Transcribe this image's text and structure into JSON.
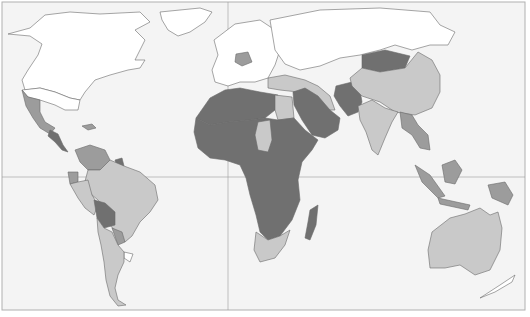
{
  "map": {
    "type": "choropleth-world",
    "projection": "equirectangular-like",
    "background": "#f4f4f4",
    "frame_color": "#b0b0b0",
    "graticule": {
      "equator_y": 177,
      "prime_meridian_x": 228,
      "color": "#9a9a9a"
    },
    "shade_classes": [
      {
        "id": "none",
        "color": "#ffffff"
      },
      {
        "id": "light",
        "color": "#c9c9c9"
      },
      {
        "id": "medium",
        "color": "#9c9c9c"
      },
      {
        "id": "dark",
        "color": "#707070"
      }
    ],
    "regions": [
      {
        "name": "North America (Canada/USA)",
        "class": "none"
      },
      {
        "name": "Greenland",
        "class": "none"
      },
      {
        "name": "Mexico",
        "class": "medium"
      },
      {
        "name": "Central America",
        "class": "dark"
      },
      {
        "name": "Caribbean",
        "class": "medium"
      },
      {
        "name": "Venezuela/Colombia",
        "class": "medium"
      },
      {
        "name": "Guyana",
        "class": "dark"
      },
      {
        "name": "Ecuador",
        "class": "medium"
      },
      {
        "name": "Brazil",
        "class": "light"
      },
      {
        "name": "Peru",
        "class": "light"
      },
      {
        "name": "Bolivia",
        "class": "dark"
      },
      {
        "name": "Paraguay",
        "class": "medium"
      },
      {
        "name": "Argentina/Chile",
        "class": "light"
      },
      {
        "name": "Uruguay",
        "class": "none"
      },
      {
        "name": "Europe",
        "class": "none"
      },
      {
        "name": "Germany",
        "class": "medium"
      },
      {
        "name": "Russia",
        "class": "none"
      },
      {
        "name": "Central Asia",
        "class": "none"
      },
      {
        "name": "Turkey/Iran",
        "class": "light"
      },
      {
        "name": "Afghanistan/Pakistan",
        "class": "dark"
      },
      {
        "name": "Mongolia",
        "class": "dark"
      },
      {
        "name": "China",
        "class": "light"
      },
      {
        "name": "India",
        "class": "light"
      },
      {
        "name": "Southeast Asia",
        "class": "medium"
      },
      {
        "name": "Indonesia",
        "class": "medium"
      },
      {
        "name": "Australia",
        "class": "light"
      },
      {
        "name": "New Zealand",
        "class": "none"
      },
      {
        "name": "North Africa",
        "class": "dark"
      },
      {
        "name": "Egypt",
        "class": "light"
      },
      {
        "name": "Chad",
        "class": "light"
      },
      {
        "name": "Sub-Saharan Africa",
        "class": "dark"
      },
      {
        "name": "Arabian Peninsula",
        "class": "dark"
      },
      {
        "name": "South Africa",
        "class": "light"
      },
      {
        "name": "Madagascar",
        "class": "dark"
      }
    ]
  }
}
